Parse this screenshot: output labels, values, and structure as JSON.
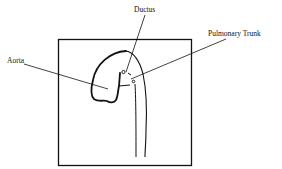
{
  "diagram": {
    "labels": {
      "ductus": "Ductus",
      "pulmonary_trunk": "Pulmonary Trunk",
      "aorta": "Aorta"
    },
    "colors": {
      "stroke": "#111111",
      "background": "#ffffff"
    }
  }
}
